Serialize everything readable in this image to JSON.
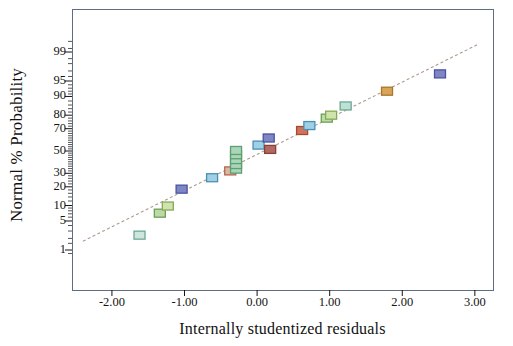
{
  "chart_data": {
    "type": "scatter",
    "title": "",
    "subtitle": "",
    "xlabel": "Internally studentized residuals",
    "ylabel": "Normal % Probability",
    "grid": false,
    "legend": null,
    "xlim": [
      -2.55,
      3.25
    ],
    "ylim_percent": [
      0.5,
      99.7
    ],
    "xticks": [
      "-2.00",
      "-1.00",
      "0.00",
      "1.00",
      "2.00",
      "3.00"
    ],
    "xtick_values": [
      -2.0,
      -1.0,
      0.0,
      1.0,
      2.0,
      3.0
    ],
    "yticks": [
      "99",
      "95",
      "90",
      "80",
      "70",
      "50",
      "30",
      "20",
      "10",
      "5",
      "1"
    ],
    "ytick_values": [
      99,
      95,
      90,
      80,
      70,
      50,
      30,
      20,
      10,
      5,
      1
    ],
    "reference_line": {
      "name": "normal-reference-line",
      "style": "dashed",
      "color": "#b09a8e",
      "x_start": -2.4,
      "y_start_percent": 1.7,
      "x_end": 3.05,
      "y_end_percent": 99.4
    },
    "marker": {
      "shape": "square",
      "width": 11,
      "height": 8,
      "stroke_width": 1.3
    },
    "points": [
      {
        "x": -1.62,
        "y_percent": 2.4,
        "fill": "#cfe6dd",
        "stroke": "#6aa894"
      },
      {
        "x": -1.34,
        "y_percent": 7.2,
        "fill": "#bcd9a8",
        "stroke": "#6f9e52"
      },
      {
        "x": -1.23,
        "y_percent": 9.8,
        "fill": "#cfe3ac",
        "stroke": "#86a957"
      },
      {
        "x": -1.04,
        "y_percent": 18.5,
        "fill": "#7f86c4",
        "stroke": "#4a52a0"
      },
      {
        "x": -0.62,
        "y_percent": 26.5,
        "fill": "#9fd0e6",
        "stroke": "#4b8fb5"
      },
      {
        "x": -0.37,
        "y_percent": 32.0,
        "fill": "#d9b9a6",
        "stroke": "#b2654a"
      },
      {
        "x": -0.29,
        "y_percent": 33.5,
        "fill": "#a9d6b8",
        "stroke": "#5d9e72"
      },
      {
        "x": -0.29,
        "y_percent": 37.5,
        "fill": "#a9d6b8",
        "stroke": "#5d9e72"
      },
      {
        "x": -0.29,
        "y_percent": 42.0,
        "fill": "#a9d6b8",
        "stroke": "#5d9e72"
      },
      {
        "x": -0.29,
        "y_percent": 46.5,
        "fill": "#a9d6b8",
        "stroke": "#5d9e72"
      },
      {
        "x": -0.29,
        "y_percent": 50.5,
        "fill": "#a9d6b8",
        "stroke": "#5d9e72"
      },
      {
        "x": 0.02,
        "y_percent": 55.5,
        "fill": "#9fd0e6",
        "stroke": "#4b8fb5"
      },
      {
        "x": 0.16,
        "y_percent": 62.0,
        "fill": "#7f86c4",
        "stroke": "#4a52a0"
      },
      {
        "x": 0.18,
        "y_percent": 51.5,
        "fill": "#b06a62",
        "stroke": "#8a3f38"
      },
      {
        "x": 0.62,
        "y_percent": 68.5,
        "fill": "#d1735a",
        "stroke": "#a84a32"
      },
      {
        "x": 0.72,
        "y_percent": 72.5,
        "fill": "#9fd0e6",
        "stroke": "#4b8fb5"
      },
      {
        "x": 0.96,
        "y_percent": 78.0,
        "fill": "#b8dda6",
        "stroke": "#6f9e52"
      },
      {
        "x": 1.02,
        "y_percent": 80.0,
        "fill": "#cfe3ac",
        "stroke": "#86a957"
      },
      {
        "x": 1.22,
        "y_percent": 85.5,
        "fill": "#bfe0d4",
        "stroke": "#6aa894"
      },
      {
        "x": 1.79,
        "y_percent": 92.0,
        "fill": "#d8a457",
        "stroke": "#a8762c"
      },
      {
        "x": 2.52,
        "y_percent": 96.5,
        "fill": "#7f86c4",
        "stroke": "#4a52a0"
      }
    ],
    "minor_tick_percents": [
      99.5,
      99.2,
      98.5,
      98,
      97,
      96,
      94,
      93,
      92,
      91,
      88,
      86,
      84,
      82,
      78,
      76,
      74,
      72,
      68,
      66,
      64,
      62,
      60,
      58,
      56,
      54,
      52,
      48,
      46,
      44,
      42,
      40,
      38,
      36,
      34,
      32,
      28,
      26,
      24,
      22,
      18,
      16,
      14,
      12,
      9,
      8,
      7,
      6,
      4,
      3,
      2,
      1.5,
      0.8
    ]
  },
  "axis": {
    "x_title": "Internally studentized residuals",
    "y_title": "Normal % Probability"
  },
  "colors": {
    "frame": "#5c6d84",
    "line": "#b09a8e",
    "text": "#141414"
  }
}
